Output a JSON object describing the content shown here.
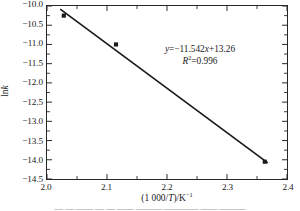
{
  "chart_data": {
    "type": "scatter",
    "title": "",
    "xlabel": "(1 000/T)/K⁻¹",
    "ylabel": "lnk",
    "xlim": [
      2.0,
      2.4
    ],
    "ylim": [
      -14.5,
      -10.0
    ],
    "grid": false,
    "legend": null,
    "x_ticks": [
      "2.0",
      "2.1",
      "2.2",
      "2.3",
      "2.4"
    ],
    "x_tick_values": [
      2.0,
      2.1,
      2.2,
      2.3,
      2.4
    ],
    "x_minor_ticks_between": 1,
    "y_ticks": [
      "-10.0",
      "-10.5",
      "-11.0",
      "-11.5",
      "-12.0",
      "-12.5",
      "-13.0",
      "-13.5",
      "-14.0",
      "-14.5"
    ],
    "y_tick_values": [
      -10.0,
      -10.5,
      -11.0,
      -11.5,
      -12.0,
      -12.5,
      -13.0,
      -13.5,
      -14.0,
      -14.5
    ],
    "y_minor_ticks_between": 1,
    "series": [
      {
        "name": "data",
        "marker": "square",
        "color": "#1a1a1a",
        "x": [
          2.028,
          2.115,
          2.363
        ],
        "y": [
          -10.25,
          -11.0,
          -14.05
        ]
      },
      {
        "name": "linear fit",
        "type": "line",
        "color": "#1a1a1a",
        "x": [
          2.022,
          2.368
        ],
        "y": [
          -10.08,
          -14.08
        ]
      }
    ],
    "fit": {
      "equation": "y=-11.542x+13.26",
      "slope": -11.542,
      "intercept": 13.26,
      "r_squared": 0.996,
      "r_squared_label": "R²=0.996"
    },
    "annotations": [
      {
        "text": "y=-11.542x+13.26"
      },
      {
        "text": "R²=0.996"
      }
    ]
  },
  "axis": {
    "y_label_prefix": "ln",
    "y_label_italic": "k",
    "x_label_open": "(1 000/",
    "x_label_italic": "T",
    "x_label_close": ")/K",
    "x_label_exponent": "−1"
  },
  "annotation": {
    "equation_y": "y",
    "equation_rest": "=−11.542",
    "equation_x": "x",
    "equation_tail": "+13.26",
    "r_symbol": "R",
    "r_exponent": "2",
    "r_value": "=0.996"
  },
  "caption": {
    "partial_text": "— — —— — — —— ——— ———— —— ———"
  }
}
